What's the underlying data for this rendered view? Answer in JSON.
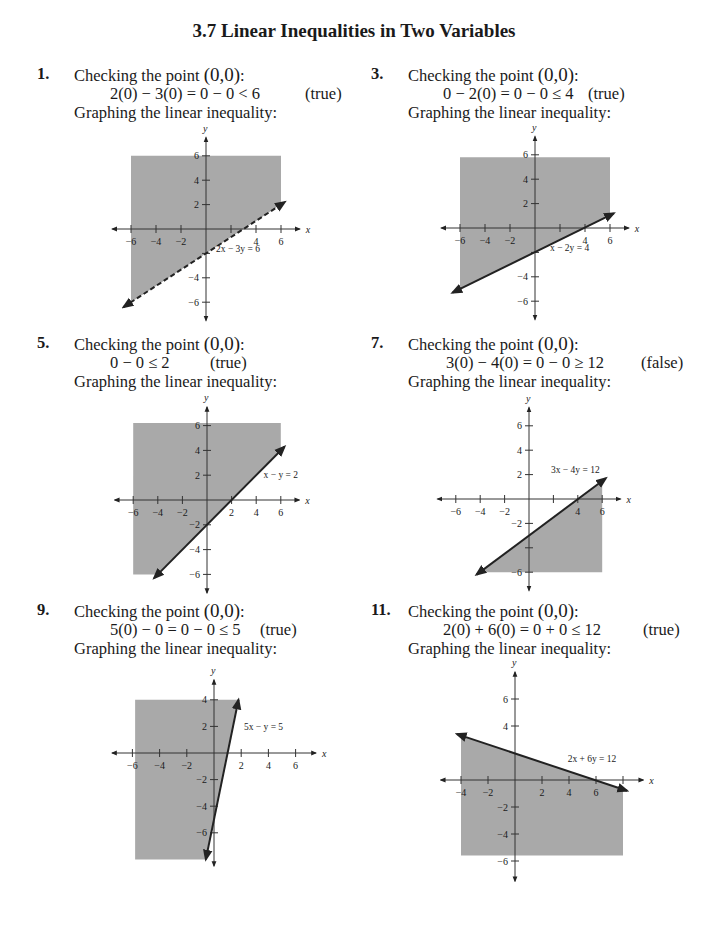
{
  "title": "3.7  Linear Inequalities in Two Variables",
  "problems": [
    {
      "num": "1.",
      "check_prefix": "Checking the point ",
      "point": "(0,0)",
      "check_suffix": ":",
      "equation": "2(0) − 3(0) = 0 − 0 < 6",
      "result": "(true)",
      "graph_label": "Graphing the linear inequality:"
    },
    {
      "num": "3.",
      "check_prefix": "Checking the point ",
      "point": "(0,0)",
      "check_suffix": ":",
      "equation": "0 − 2(0) = 0 − 0 ≤ 4",
      "result": "(true)",
      "graph_label": "Graphing the linear inequality:"
    },
    {
      "num": "5.",
      "check_prefix": "Checking the point ",
      "point": "(0,0)",
      "check_suffix": ":",
      "equation": "0 − 0 ≤ 2",
      "result": "(true)",
      "graph_label": "Graphing the linear inequality:"
    },
    {
      "num": "7.",
      "check_prefix": "Checking the point ",
      "point": "(0,0)",
      "check_suffix": ":",
      "equation": "3(0) − 4(0) = 0 − 0 ≥ 12",
      "result": "(false)",
      "graph_label": "Graphing the linear inequality:"
    },
    {
      "num": "9.",
      "check_prefix": "Checking the point ",
      "point": "(0,0)",
      "check_suffix": ":",
      "equation": "5(0) − 0 = 0 − 0 ≤ 5",
      "result": "(true)",
      "graph_label": "Graphing the linear inequality:"
    },
    {
      "num": "11.",
      "check_prefix": "Checking the point ",
      "point": "(0,0)",
      "check_suffix": ":",
      "equation": "2(0) + 6(0) = 0 + 0 ≤ 12",
      "result": "(true)",
      "graph_label": "Graphing the linear inequality:"
    }
  ],
  "colors": {
    "shade": "#a9a9a9",
    "axis": "#333333",
    "line": "#222222",
    "text": "#1a1a1a"
  },
  "chart_data": [
    {
      "type": "area",
      "title": "2x − 3y < 6",
      "line_label": "2x − 3y = 6",
      "line_style": "dashed",
      "line": {
        "slope": 0.6667,
        "intercept": -2
      },
      "line_segment": [
        [
          -6.6,
          -6.4
        ],
        [
          6.3,
          2.2
        ]
      ],
      "shaded_polygon": [
        [
          -6,
          6
        ],
        [
          6,
          6
        ],
        [
          6,
          2
        ],
        [
          -6,
          -6
        ]
      ],
      "x_ticks": [
        -6,
        -4,
        -2,
        2,
        4,
        6
      ],
      "x_tick_labels": [
        "-6",
        "-4",
        "-2",
        "",
        "4",
        "6"
      ],
      "y_ticks": [
        -6,
        -4,
        -2,
        2,
        4,
        6
      ],
      "y_tick_labels": [
        "-6",
        "-4",
        "",
        "2",
        "4",
        "6"
      ],
      "xlabel": "x",
      "ylabel": "y",
      "xlim": [
        -7.5,
        7.5
      ],
      "ylim": [
        -7.5,
        7.5
      ]
    },
    {
      "type": "area",
      "title": "x − 2y ≤ 4",
      "line_label": "x − 2y = 4",
      "line_style": "solid",
      "line": {
        "slope": 0.5,
        "intercept": -2
      },
      "line_segment": [
        [
          -6.6,
          -5.3
        ],
        [
          6.3,
          1.2
        ]
      ],
      "shaded_polygon": [
        [
          -6,
          5.8
        ],
        [
          6,
          5.8
        ],
        [
          6,
          1
        ],
        [
          -6,
          -5
        ]
      ],
      "x_ticks": [
        -6,
        -4,
        -2,
        2,
        4,
        6
      ],
      "x_tick_labels": [
        "-6",
        "-4",
        "-2",
        "",
        "4",
        "6"
      ],
      "y_ticks": [
        -6,
        -4,
        -2,
        2,
        4,
        6
      ],
      "y_tick_labels": [
        "-6",
        "-4",
        "",
        "2",
        "4",
        "6"
      ],
      "xlabel": "x",
      "ylabel": "y",
      "xlim": [
        -7.5,
        7.5
      ],
      "ylim": [
        -7.5,
        7.5
      ]
    },
    {
      "type": "area",
      "title": "x − y ≤ 2",
      "line_label": "x − y = 2",
      "line_style": "solid",
      "line": {
        "slope": 1,
        "intercept": -2
      },
      "line_segment": [
        [
          -4.3,
          -6.3
        ],
        [
          6.3,
          4.3
        ]
      ],
      "shaded_polygon": [
        [
          -6,
          6.2
        ],
        [
          6,
          6.2
        ],
        [
          6,
          4
        ],
        [
          -4,
          -6
        ],
        [
          -6,
          -6
        ]
      ],
      "x_ticks": [
        -6,
        -4,
        -2,
        2,
        4,
        6
      ],
      "x_tick_labels": [
        "-6",
        "-4",
        "-2",
        "2",
        "4",
        "6"
      ],
      "y_ticks": [
        -6,
        -4,
        -2,
        2,
        4,
        6
      ],
      "y_tick_labels": [
        "-6",
        "-4",
        "-2",
        "2",
        "4",
        "6"
      ],
      "xlabel": "x",
      "ylabel": "y",
      "xlim": [
        -7.5,
        7.5
      ],
      "ylim": [
        -7.5,
        7.5
      ]
    },
    {
      "type": "area",
      "title": "3x − 4y ≥ 12",
      "line_label": "3x − 4y = 12",
      "line_style": "solid",
      "line": {
        "slope": 0.75,
        "intercept": -3
      },
      "line_segment": [
        [
          -4.3,
          -6.2
        ],
        [
          6.3,
          1.7
        ]
      ],
      "shaded_polygon": [
        [
          -4,
          -6
        ],
        [
          6,
          1.5
        ],
        [
          6,
          -6
        ]
      ],
      "x_ticks": [
        -6,
        -4,
        -2,
        2,
        4,
        6
      ],
      "x_tick_labels": [
        "-6",
        "-4",
        "-2",
        "",
        "4",
        "6"
      ],
      "y_ticks": [
        -6,
        -4,
        -2,
        2,
        4,
        6
      ],
      "y_tick_labels": [
        "-6",
        "",
        "-2",
        "2",
        "4",
        "6"
      ],
      "xlabel": "x",
      "ylabel": "y",
      "xlim": [
        -7.5,
        7.5
      ],
      "ylim": [
        -7.5,
        7.5
      ]
    },
    {
      "type": "area",
      "title": "5x − y ≤ 5",
      "line_label": "5x − y = 5",
      "line_style": "solid",
      "line": {
        "slope": 5,
        "intercept": -5
      },
      "line_segment": [
        [
          -0.6,
          -8
        ],
        [
          1.8,
          4
        ]
      ],
      "shaded_polygon": [
        [
          -5.8,
          4
        ],
        [
          1.8,
          4
        ],
        [
          -0.6,
          -8
        ],
        [
          -5.8,
          -8
        ]
      ],
      "x_ticks": [
        -6,
        -4,
        -2,
        2,
        4,
        6
      ],
      "x_tick_labels": [
        "-6",
        "-4",
        "-2",
        "2",
        "4",
        "6"
      ],
      "y_ticks": [
        -6,
        -4,
        -2,
        2,
        4
      ],
      "y_tick_labels": [
        "-6",
        "-4",
        "-2",
        "2",
        "4"
      ],
      "xlabel": "x",
      "ylabel": "y",
      "xlim": [
        -7.5,
        7.5
      ],
      "ylim": [
        -8.5,
        5.5
      ]
    },
    {
      "type": "area",
      "title": "2x + 6y ≤ 12",
      "line_label": "2x + 6y = 12",
      "line_style": "solid",
      "line": {
        "slope": -0.3333,
        "intercept": 2
      },
      "line_segment": [
        [
          -4.3,
          3.4
        ],
        [
          8.3,
          -0.8
        ]
      ],
      "shaded_polygon": [
        [
          -4,
          3.3
        ],
        [
          8,
          -0.7
        ],
        [
          8,
          -5.6
        ],
        [
          -4,
          -5.6
        ]
      ],
      "x_ticks": [
        -4,
        -2,
        2,
        4,
        6,
        8
      ],
      "x_tick_labels": [
        "-4",
        "-2",
        "2",
        "4",
        "6",
        ""
      ],
      "y_ticks": [
        -6,
        -4,
        -2,
        4,
        6
      ],
      "y_tick_labels": [
        "-6",
        "-4",
        "-2",
        "4",
        "6"
      ],
      "xlabel": "x",
      "ylabel": "y",
      "xlim": [
        -5.5,
        9.5
      ],
      "ylim": [
        -7.5,
        8
      ]
    }
  ]
}
